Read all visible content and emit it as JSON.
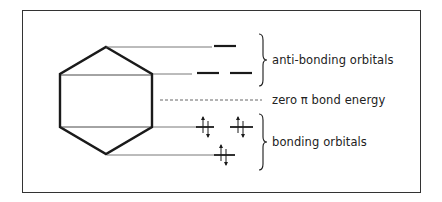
{
  "diagram": {
    "labels": {
      "anti_bonding": "anti-bonding orbitals",
      "zero_energy": "zero π bond energy",
      "bonding": "bonding orbitals"
    },
    "colors": {
      "ink": "#1a1a1a",
      "frame": "#333333",
      "background": "#ffffff"
    },
    "orbitals": [
      {
        "level": "highest antibonding",
        "count": 1,
        "electrons": 0
      },
      {
        "level": "degenerate antibonding",
        "count": 2,
        "electrons": 0
      },
      {
        "level": "degenerate bonding",
        "count": 2,
        "electrons": 4
      },
      {
        "level": "lowest bonding",
        "count": 1,
        "electrons": 2
      }
    ]
  }
}
